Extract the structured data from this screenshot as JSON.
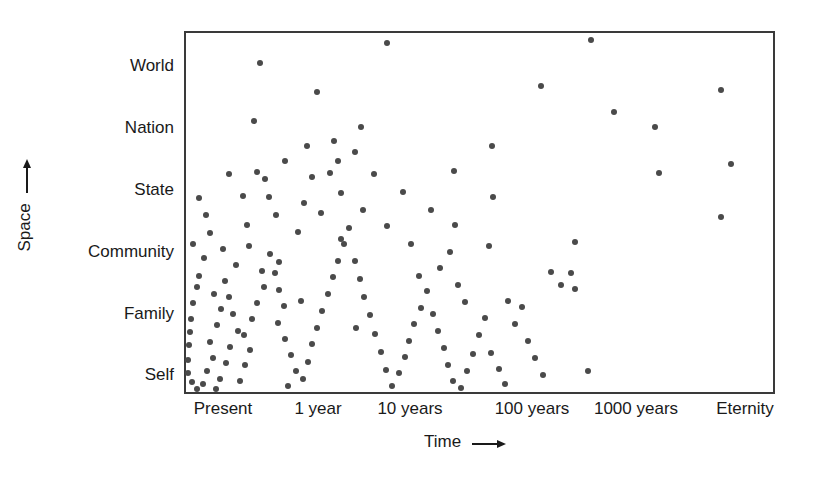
{
  "chart_data": {
    "type": "scatter",
    "title": "",
    "xlabel": "Time →",
    "ylabel": "Space →",
    "grid": false,
    "legend": "none",
    "x_axis": {
      "label": "Time",
      "arrow": "→",
      "tick_labels": [
        "Present",
        "1 year",
        "10 years",
        "100 years",
        "1000 years",
        "Eternity"
      ],
      "tick_positions_px": [
        223,
        318,
        410,
        532,
        636,
        745
      ],
      "scale": "logarithmic-categorical"
    },
    "y_axis": {
      "label": "Space",
      "arrow": "→",
      "tick_labels": [
        "World",
        "Nation",
        "State",
        "Community",
        "Family",
        "Self"
      ],
      "tick_positions_px": [
        66,
        128,
        190,
        252,
        314,
        375
      ],
      "direction": "increasing-upward"
    },
    "marker": {
      "shape": "circle",
      "color": "#4a4a4a",
      "size_px": 6
    },
    "point_count": 144,
    "points": [
      [
        0.125,
        0.918
      ],
      [
        0.222,
        0.838
      ],
      [
        0.115,
        0.758
      ],
      [
        0.296,
        0.742
      ],
      [
        0.12,
        0.617
      ],
      [
        0.244,
        0.613
      ],
      [
        0.2,
        0.533
      ],
      [
        0.103,
        0.472
      ],
      [
        0.34,
        0.972
      ],
      [
        0.453,
        0.62
      ],
      [
        0.455,
        0.47
      ],
      [
        0.395,
        0.33
      ],
      [
        0.288,
        0.188
      ],
      [
        0.195,
        0.262
      ],
      [
        0.157,
        0.368
      ],
      [
        0.262,
        0.432
      ],
      [
        0.685,
        0.982
      ],
      [
        0.6,
        0.855
      ],
      [
        0.725,
        0.782
      ],
      [
        0.517,
        0.69
      ],
      [
        0.52,
        0.547
      ],
      [
        0.793,
        0.742
      ],
      [
        0.8,
        0.615
      ],
      [
        0.512,
        0.412
      ],
      [
        0.618,
        0.342
      ],
      [
        0.634,
        0.305
      ],
      [
        0.545,
        0.262
      ],
      [
        0.68,
        0.07
      ],
      [
        0.905,
        0.842
      ],
      [
        0.922,
        0.64
      ],
      [
        0.658,
        0.425
      ],
      [
        0.652,
        0.338
      ],
      [
        0.658,
        0.295
      ],
      [
        0.905,
        0.492
      ],
      [
        0.04,
        0.45
      ],
      [
        0.03,
        0.38
      ],
      [
        0.022,
        0.33
      ],
      [
        0.018,
        0.3
      ],
      [
        0.012,
        0.255
      ],
      [
        0.008,
        0.212
      ],
      [
        0.006,
        0.175
      ],
      [
        0.005,
        0.14
      ],
      [
        0.004,
        0.098
      ],
      [
        0.003,
        0.062
      ],
      [
        0.01,
        0.038
      ],
      [
        0.018,
        0.02
      ],
      [
        0.028,
        0.032
      ],
      [
        0.035,
        0.068
      ],
      [
        0.046,
        0.105
      ],
      [
        0.04,
        0.15
      ],
      [
        0.052,
        0.195
      ],
      [
        0.06,
        0.24
      ],
      [
        0.048,
        0.282
      ],
      [
        0.066,
        0.318
      ],
      [
        0.072,
        0.272
      ],
      [
        0.08,
        0.225
      ],
      [
        0.088,
        0.18
      ],
      [
        0.075,
        0.135
      ],
      [
        0.068,
        0.092
      ],
      [
        0.058,
        0.048
      ],
      [
        0.05,
        0.018
      ],
      [
        0.092,
        0.042
      ],
      [
        0.1,
        0.085
      ],
      [
        0.108,
        0.128
      ],
      [
        0.098,
        0.168
      ],
      [
        0.112,
        0.212
      ],
      [
        0.12,
        0.255
      ],
      [
        0.132,
        0.3
      ],
      [
        0.128,
        0.345
      ],
      [
        0.142,
        0.39
      ],
      [
        0.15,
        0.34
      ],
      [
        0.158,
        0.292
      ],
      [
        0.166,
        0.248
      ],
      [
        0.155,
        0.2
      ],
      [
        0.168,
        0.158
      ],
      [
        0.178,
        0.112
      ],
      [
        0.186,
        0.068
      ],
      [
        0.172,
        0.028
      ],
      [
        0.198,
        0.048
      ],
      [
        0.206,
        0.095
      ],
      [
        0.214,
        0.142
      ],
      [
        0.222,
        0.188
      ],
      [
        0.23,
        0.235
      ],
      [
        0.24,
        0.282
      ],
      [
        0.248,
        0.328
      ],
      [
        0.258,
        0.372
      ],
      [
        0.268,
        0.418
      ],
      [
        0.276,
        0.462
      ],
      [
        0.286,
        0.372
      ],
      [
        0.294,
        0.322
      ],
      [
        0.302,
        0.272
      ],
      [
        0.312,
        0.222
      ],
      [
        0.32,
        0.172
      ],
      [
        0.33,
        0.122
      ],
      [
        0.338,
        0.072
      ],
      [
        0.348,
        0.028
      ],
      [
        0.36,
        0.062
      ],
      [
        0.37,
        0.108
      ],
      [
        0.378,
        0.152
      ],
      [
        0.386,
        0.198
      ],
      [
        0.398,
        0.242
      ],
      [
        0.408,
        0.288
      ],
      [
        0.418,
        0.225
      ],
      [
        0.426,
        0.178
      ],
      [
        0.436,
        0.132
      ],
      [
        0.444,
        0.085
      ],
      [
        0.452,
        0.04
      ],
      [
        0.466,
        0.022
      ],
      [
        0.476,
        0.068
      ],
      [
        0.486,
        0.115
      ],
      [
        0.38,
        0.42
      ],
      [
        0.34,
        0.468
      ],
      [
        0.3,
        0.512
      ],
      [
        0.262,
        0.558
      ],
      [
        0.228,
        0.505
      ],
      [
        0.19,
        0.452
      ],
      [
        0.214,
        0.602
      ],
      [
        0.258,
        0.648
      ],
      [
        0.152,
        0.498
      ],
      [
        0.14,
        0.548
      ],
      [
        0.106,
        0.412
      ],
      [
        0.084,
        0.36
      ],
      [
        0.062,
        0.405
      ],
      [
        0.034,
        0.498
      ],
      [
        0.022,
        0.545
      ],
      [
        0.012,
        0.42
      ],
      [
        0.496,
        0.168
      ],
      [
        0.506,
        0.215
      ],
      [
        0.516,
        0.118
      ],
      [
        0.53,
        0.075
      ],
      [
        0.54,
        0.032
      ],
      [
        0.556,
        0.198
      ],
      [
        0.568,
        0.245
      ],
      [
        0.578,
        0.152
      ],
      [
        0.59,
        0.105
      ],
      [
        0.604,
        0.058
      ],
      [
        0.43,
        0.352
      ],
      [
        0.446,
        0.398
      ],
      [
        0.46,
        0.305
      ],
      [
        0.472,
        0.258
      ],
      [
        0.368,
        0.562
      ],
      [
        0.414,
        0.512
      ],
      [
        0.318,
        0.612
      ],
      [
        0.286,
        0.672
      ],
      [
        0.25,
        0.702
      ],
      [
        0.204,
        0.688
      ],
      [
        0.168,
        0.648
      ],
      [
        0.134,
        0.598
      ],
      [
        0.096,
        0.552
      ],
      [
        0.072,
        0.612
      ]
    ]
  }
}
